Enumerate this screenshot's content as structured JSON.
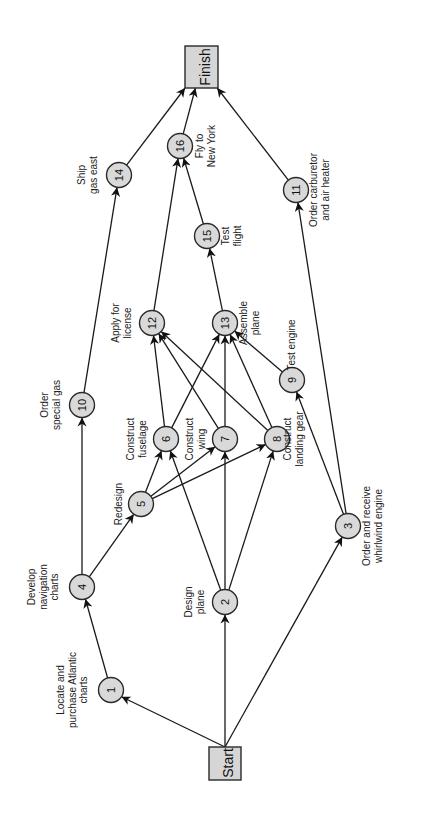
{
  "diagram": {
    "type": "activity-network",
    "orientation": "rotated-90-ccw",
    "colors": {
      "node_fill": "#d9d9d9",
      "stroke": "#1a1a1a",
      "background": "#ffffff"
    },
    "start": {
      "label": "Start"
    },
    "finish": {
      "label": "Finish"
    },
    "nodes": [
      {
        "id": "1",
        "label_lines": [
          "Locate and",
          "purchase Atlantic",
          "charts"
        ]
      },
      {
        "id": "2",
        "label_lines": [
          "Design",
          "plane"
        ]
      },
      {
        "id": "3",
        "label_lines": [
          "Order and receive",
          "whirlwind engine"
        ]
      },
      {
        "id": "4",
        "label_lines": [
          "Develop",
          "navigation",
          "charts"
        ]
      },
      {
        "id": "5",
        "label_lines": [
          "Redesign"
        ]
      },
      {
        "id": "6",
        "label_lines": [
          "Construct",
          "fuselage"
        ]
      },
      {
        "id": "7",
        "label_lines": [
          "Construct",
          "wing"
        ]
      },
      {
        "id": "8",
        "label_lines": [
          "Construct",
          "landing gear"
        ]
      },
      {
        "id": "9",
        "label_lines": [
          "Test engine"
        ]
      },
      {
        "id": "10",
        "label_lines": [
          "Order",
          "special gas"
        ]
      },
      {
        "id": "11",
        "label_lines": [
          "Order carburetor",
          "and air heater"
        ]
      },
      {
        "id": "12",
        "label_lines": [
          "Apply for",
          "license"
        ]
      },
      {
        "id": "13",
        "label_lines": [
          "Assemble",
          "plane"
        ]
      },
      {
        "id": "14",
        "label_lines": [
          "Ship",
          "gas east"
        ]
      },
      {
        "id": "15",
        "label_lines": [
          "Test",
          "flight"
        ]
      },
      {
        "id": "16",
        "label_lines": [
          "Fly to",
          "New York"
        ]
      }
    ],
    "edges": [
      [
        "Start",
        "1"
      ],
      [
        "Start",
        "2"
      ],
      [
        "Start",
        "3"
      ],
      [
        "1",
        "4"
      ],
      [
        "4",
        "5"
      ],
      [
        "4",
        "10"
      ],
      [
        "10",
        "14"
      ],
      [
        "14",
        "Finish"
      ],
      [
        "2",
        "6"
      ],
      [
        "2",
        "7"
      ],
      [
        "2",
        "8"
      ],
      [
        "5",
        "6"
      ],
      [
        "5",
        "7"
      ],
      [
        "5",
        "8"
      ],
      [
        "6",
        "12"
      ],
      [
        "6",
        "13"
      ],
      [
        "7",
        "12"
      ],
      [
        "7",
        "13"
      ],
      [
        "8",
        "12"
      ],
      [
        "8",
        "13"
      ],
      [
        "3",
        "9"
      ],
      [
        "3",
        "11"
      ],
      [
        "9",
        "13"
      ],
      [
        "12",
        "16"
      ],
      [
        "13",
        "15"
      ],
      [
        "15",
        "16"
      ],
      [
        "16",
        "Finish"
      ],
      [
        "11",
        "Finish"
      ]
    ]
  }
}
